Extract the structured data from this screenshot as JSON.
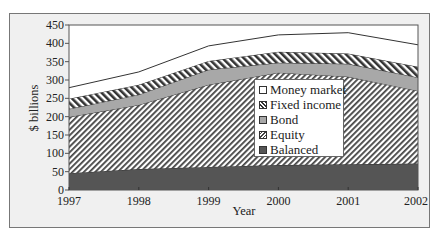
{
  "chart_data": {
    "type": "area",
    "stacked": true,
    "title": "",
    "xlabel": "Year",
    "ylabel": "$ billions",
    "x": [
      1997,
      1998,
      1999,
      2000,
      2001,
      2002
    ],
    "ylim": [
      0,
      450
    ],
    "yticks": [
      0,
      50,
      100,
      150,
      200,
      250,
      300,
      350,
      400,
      450
    ],
    "grid": false,
    "legend_position": "inside-center-right",
    "series": [
      {
        "name": "Balanced",
        "values": [
          46,
          57,
          63,
          68,
          70,
          72
        ],
        "cumulative_top": [
          46,
          57,
          63,
          68,
          70,
          72
        ],
        "color": "#555555",
        "pattern": "solid"
      },
      {
        "name": "Equity",
        "values": [
          153,
          175,
          224,
          252,
          239,
          198
        ],
        "cumulative_top": [
          199,
          232,
          287,
          320,
          309,
          270
        ],
        "color": "#444444",
        "pattern": "diagonal-hatch"
      },
      {
        "name": "Bond",
        "values": [
          22,
          28,
          41,
          27,
          35,
          37
        ],
        "cumulative_top": [
          221,
          260,
          328,
          347,
          344,
          307
        ],
        "color": "#a8a8a8",
        "pattern": "solid"
      },
      {
        "name": "Fixed income",
        "values": [
          28,
          27,
          24,
          30,
          28,
          29
        ],
        "cumulative_top": [
          249,
          287,
          352,
          377,
          372,
          336
        ],
        "color": "#333333",
        "pattern": "back-diagonal-hatch"
      },
      {
        "name": "Money market",
        "values": [
          30,
          35,
          41,
          46,
          57,
          60
        ],
        "cumulative_top": [
          279,
          322,
          393,
          423,
          429,
          396
        ],
        "color": "#ffffff",
        "pattern": "solid"
      }
    ]
  },
  "legend": {
    "items": [
      {
        "label": "Money market",
        "key": "money"
      },
      {
        "label": "Fixed income",
        "key": "fixed"
      },
      {
        "label": "Bond",
        "key": "bond"
      },
      {
        "label": "Equity",
        "key": "equity"
      },
      {
        "label": "Balanced",
        "key": "balanced"
      }
    ]
  },
  "axes": {
    "y_label": "$ billions",
    "x_label": "Year",
    "y_ticks": [
      "0",
      "50",
      "100",
      "150",
      "200",
      "250",
      "300",
      "350",
      "400",
      "450"
    ],
    "x_ticks": [
      "1997",
      "1998",
      "1999",
      "2000",
      "2001",
      "2002"
    ]
  }
}
